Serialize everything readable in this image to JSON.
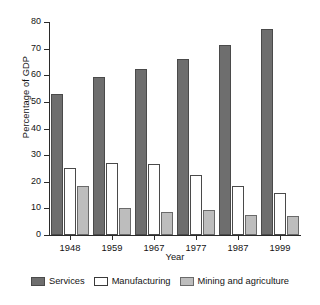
{
  "chart_data": {
    "type": "bar",
    "title": "",
    "subtitle": "",
    "xlabel": "Year",
    "ylabel": "Percentage of GDP",
    "categories": [
      "1948",
      "1959",
      "1967",
      "1977",
      "1987",
      "1999"
    ],
    "series": [
      {
        "name": "Services",
        "color": "#6e6e6e",
        "values": [
          53,
          59.5,
          62.5,
          66,
          71.5,
          77.5
        ]
      },
      {
        "name": "Manufacturing",
        "color": "#ffffff",
        "values": [
          25.3,
          27,
          26.5,
          22.4,
          18.4,
          15.7
        ]
      },
      {
        "name": "Mining and agriculture",
        "color": "#bdbdbd",
        "values": [
          18.4,
          10.3,
          8.7,
          9.5,
          7.5,
          7
        ]
      }
    ],
    "ylim": [
      0,
      80
    ],
    "yticks": [
      0,
      10,
      20,
      30,
      40,
      50,
      60,
      70,
      80
    ],
    "ytick_labels": [
      "0",
      "10",
      "20",
      "30",
      "40",
      "50",
      "60",
      "70",
      "80"
    ],
    "grid": false,
    "legend_position": "bottom"
  }
}
